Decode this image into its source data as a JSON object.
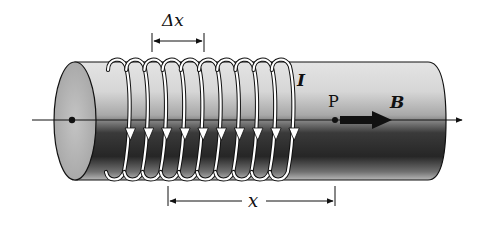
{
  "diagram": {
    "labels": {
      "delta_x": "Δx",
      "current": "I",
      "point": "P",
      "field": "B",
      "distance": "x"
    },
    "coil": {
      "turns": 10,
      "current_direction": "downward on front face"
    },
    "colors": {
      "background": "#ffffff",
      "cylinder_light": "#d8d8d8",
      "cylinder_dark": "#2a2a2a",
      "end_face": "#b5b5b5",
      "coil": "#ffffff",
      "outline": "#111111"
    }
  }
}
